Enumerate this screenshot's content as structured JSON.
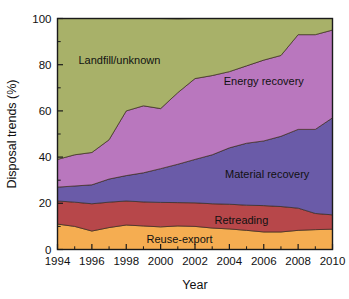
{
  "chart_data": {
    "type": "area",
    "title": "",
    "xlabel": "Year",
    "ylabel": "Disposal trends (%)",
    "xlim": [
      1994,
      2010
    ],
    "ylim": [
      0,
      100
    ],
    "grid": false,
    "stacked": true,
    "legend_position": "inline-annotations",
    "x": [
      1994,
      1995,
      1996,
      1997,
      1998,
      1999,
      2000,
      2001,
      2002,
      2003,
      2004,
      2005,
      2006,
      2007,
      2008,
      2009,
      2010
    ],
    "xticks": [
      "1994",
      "1996",
      "1998",
      "2000",
      "2002",
      "2004",
      "2006",
      "2008",
      "2010"
    ],
    "xtick_values": [
      1994,
      1996,
      1998,
      2000,
      2002,
      2004,
      2006,
      2008,
      2010
    ],
    "yticks": [
      "0",
      "20",
      "40",
      "60",
      "80",
      "100"
    ],
    "ytick_values": [
      0,
      20,
      40,
      60,
      80,
      100
    ],
    "series": [
      {
        "name": "Reuse-export",
        "color": "#F5AD51",
        "label_x": 2001.1,
        "label_y": 4.4,
        "values": [
          11.0,
          10.0,
          8.0,
          9.5,
          10.6,
          10.2,
          9.8,
          10.2,
          10.0,
          9.3,
          8.9,
          8.3,
          7.6,
          7.6,
          8.3,
          8.6,
          8.8
        ]
      },
      {
        "name": "Retreading",
        "color": "#B7474A",
        "label_x": 2004.7,
        "label_y": 12.6,
        "values": [
          10.0,
          10.5,
          11.8,
          11.0,
          10.4,
          10.4,
          10.6,
          10.1,
          10.2,
          10.5,
          10.7,
          10.9,
          11.4,
          11.0,
          9.6,
          7.0,
          6.2
        ]
      },
      {
        "name": "Material recovery",
        "color": "#6A5BA8",
        "label_x": 2006.2,
        "label_y": 32.5,
        "values": [
          6.0,
          7.0,
          8.2,
          10.0,
          11.0,
          12.6,
          14.6,
          16.6,
          18.8,
          21.2,
          24.4,
          26.8,
          28.0,
          30.4,
          34.1,
          36.4,
          42.0
        ]
      },
      {
        "name": "Energy recovery",
        "color": "#B977BE",
        "label_x": 2006.0,
        "label_y": 73.0,
        "values": [
          12.0,
          13.5,
          14.0,
          17.0,
          28.0,
          29.0,
          26.0,
          31.0,
          35.0,
          34.3,
          33.0,
          33.5,
          35.0,
          35.0,
          41.0,
          41.0,
          38.0
        ]
      },
      {
        "name": "Landfill/unknown",
        "color": "#A8B169",
        "label_x": 1997.6,
        "label_y": 82.0,
        "values": [
          61.0,
          59.0,
          58.0,
          52.5,
          40.0,
          37.8,
          39.0,
          31.9,
          26.0,
          24.7,
          23.0,
          20.5,
          18.0,
          16.0,
          7.0,
          7.0,
          5.0
        ]
      }
    ]
  }
}
